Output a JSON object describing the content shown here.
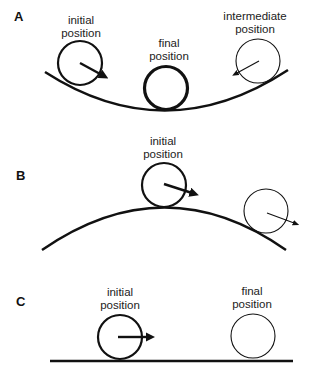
{
  "diagram": {
    "colors": {
      "stroke": "#111111",
      "text": "#222222",
      "background": "#ffffff"
    },
    "panels": [
      {
        "id": "A",
        "label": "A",
        "surface": "concave-bowl",
        "balls": [
          {
            "role": "initial",
            "label_line1": "initial",
            "label_line2": "position",
            "arrow": "down-right (thick)"
          },
          {
            "role": "final",
            "label_line1": "final",
            "label_line2": "position",
            "arrow": "none"
          },
          {
            "role": "intermediate",
            "label_line1": "intermediate",
            "label_line2": "position",
            "arrow": "down-left (thin)"
          }
        ]
      },
      {
        "id": "B",
        "label": "B",
        "surface": "convex-hill",
        "balls": [
          {
            "role": "initial",
            "label_line1": "initial",
            "label_line2": "position",
            "arrow": "right-down (thick)"
          },
          {
            "role": "rolling-away",
            "label_line1": "",
            "label_line2": "",
            "arrow": "right-down (thin)"
          }
        ]
      },
      {
        "id": "C",
        "label": "C",
        "surface": "flat",
        "balls": [
          {
            "role": "initial",
            "label_line1": "initial",
            "label_line2": "position",
            "arrow": "right (thick)"
          },
          {
            "role": "final",
            "label_line1": "final",
            "label_line2": "position",
            "arrow": "none"
          }
        ]
      }
    ]
  }
}
